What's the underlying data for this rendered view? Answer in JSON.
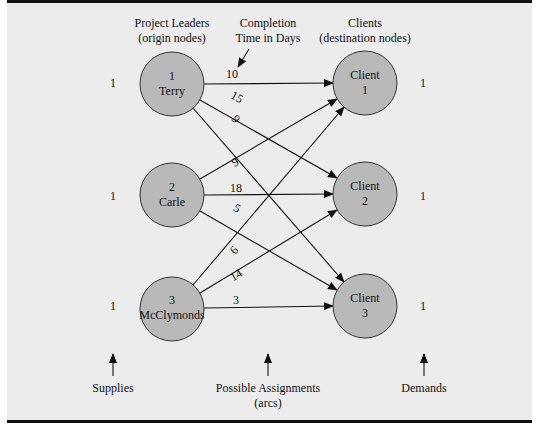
{
  "headers": {
    "origins": [
      "Project Leaders",
      "(origin nodes)"
    ],
    "completion": [
      "Completion",
      "Time in Days"
    ],
    "destinations": [
      "Clients",
      "(destination nodes)"
    ]
  },
  "origins": [
    {
      "id": "1",
      "name": "Terry",
      "supply": "1"
    },
    {
      "id": "2",
      "name": "Carle",
      "supply": "1"
    },
    {
      "id": "3",
      "name": "McClymonds",
      "supply": "1"
    }
  ],
  "destinations": [
    {
      "label": "Client",
      "id": "1",
      "demand": "1"
    },
    {
      "label": "Client",
      "id": "2",
      "demand": "1"
    },
    {
      "label": "Client",
      "id": "3",
      "demand": "1"
    }
  ],
  "arcs": [
    {
      "from": "1",
      "to": "1",
      "days": "10"
    },
    {
      "from": "1",
      "to": "2",
      "days": "15"
    },
    {
      "from": "1",
      "to": "3",
      "days": "9"
    },
    {
      "from": "2",
      "to": "1",
      "days": "9"
    },
    {
      "from": "2",
      "to": "2",
      "days": "18"
    },
    {
      "from": "2",
      "to": "3",
      "days": "5"
    },
    {
      "from": "3",
      "to": "1",
      "days": "6"
    },
    {
      "from": "3",
      "to": "2",
      "days": "14"
    },
    {
      "from": "3",
      "to": "3",
      "days": "3"
    }
  ],
  "footer": {
    "supplies": "Supplies",
    "assignments": [
      "Possible Assignments",
      "(arcs)"
    ],
    "demands": "Demands"
  },
  "colors": {
    "node_fill": "#b9b9b9",
    "background": "#ececec",
    "line": "#111111"
  }
}
